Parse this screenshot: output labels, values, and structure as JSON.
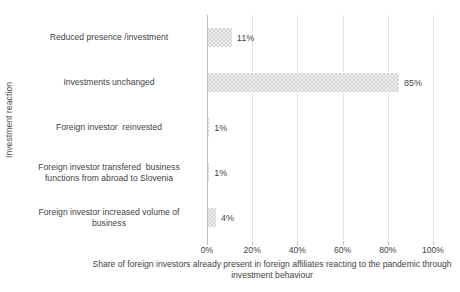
{
  "chart_data": {
    "type": "bar",
    "orientation": "horizontal",
    "title": "",
    "xlabel": "Share of foreign investors already present in foreign affiliates reacting to the pandemic through investment behaviour",
    "ylabel": "Investment reaction",
    "categories": [
      "Reduced presence /investment",
      "Investments unchanged",
      "Foreign investor  reinvested",
      "Foreign investor transfered  business functions from abroad to Slovenia",
      "Foreign investor increased volume of business"
    ],
    "category_lines": [
      [
        "Reduced presence /investment"
      ],
      [
        "Investments unchanged"
      ],
      [
        "Foreign investor  reinvested"
      ],
      [
        "Foreign investor transfered  business",
        "functions from abroad to Slovenia"
      ],
      [
        "Foreign investor increased volume of",
        "business"
      ]
    ],
    "values": [
      11,
      85,
      1,
      1,
      4
    ],
    "value_labels": [
      "11%",
      "85%",
      "1%",
      "1%",
      "4%"
    ],
    "xlim": [
      0,
      100
    ],
    "xticks": [
      0,
      20,
      40,
      60,
      80,
      100
    ],
    "xtick_labels": [
      "0%",
      "20%",
      "40%",
      "60%",
      "80%",
      "100%"
    ],
    "grid": true,
    "legend": "none",
    "bar_color": "#d6d6d6",
    "gridline_color": "#e4e4e4",
    "axis_color": "#bfbfbf",
    "text_color": "#3f3f3f"
  }
}
